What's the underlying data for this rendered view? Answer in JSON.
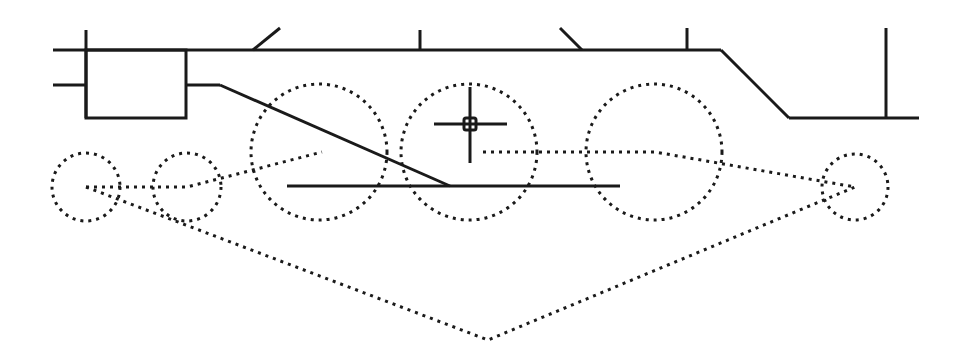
{
  "canvas": {
    "width": 954,
    "height": 362,
    "background": "#ffffff",
    "ink_color": "#1a1a1a"
  },
  "frame": {
    "top_line": [
      [
        53,
        50
      ],
      [
        721,
        50
      ]
    ],
    "cab_slope": [
      [
        721,
        50
      ],
      [
        789,
        118
      ]
    ],
    "bottom_right_line": [
      [
        789,
        118
      ],
      [
        919,
        118
      ]
    ],
    "verticals": [
      [
        [
          86,
          30
        ],
        [
          86,
          118
        ]
      ],
      [
        [
          420,
          30
        ],
        [
          420,
          50
        ]
      ],
      [
        [
          687,
          28
        ],
        [
          687,
          50
        ]
      ],
      [
        [
          886,
          28
        ],
        [
          886,
          118
        ]
      ]
    ],
    "slant_stubs": [
      [
        [
          253,
          50
        ],
        [
          280,
          28
        ]
      ],
      [
        [
          582,
          50
        ],
        [
          560,
          28
        ]
      ]
    ],
    "box": {
      "x": 86,
      "y": 50,
      "w": 100,
      "h": 68
    },
    "left_stub": [
      [
        53,
        85
      ],
      [
        86,
        85
      ]
    ],
    "right_stub": [
      [
        186,
        85
      ],
      [
        220,
        85
      ]
    ],
    "connecting_rod": [
      [
        220,
        85
      ],
      [
        450,
        186
      ]
    ],
    "main_rod": [
      [
        287,
        186
      ],
      [
        620,
        186
      ]
    ]
  },
  "wheels": [
    {
      "name": "front-small-wheel-1",
      "cx": 86,
      "cy": 187,
      "r": 34
    },
    {
      "name": "front-small-wheel-2",
      "cx": 187,
      "cy": 187,
      "r": 34
    },
    {
      "name": "driver-wheel-1",
      "cx": 319,
      "cy": 152,
      "r": 68
    },
    {
      "name": "driver-wheel-2",
      "cx": 469,
      "cy": 152,
      "r": 68
    },
    {
      "name": "driver-wheel-3",
      "cx": 654,
      "cy": 152,
      "r": 68
    },
    {
      "name": "rear-small-wheel",
      "cx": 855,
      "cy": 187,
      "r": 33
    }
  ],
  "links": [
    {
      "name": "front-link",
      "points": [
        [
          86,
          187
        ],
        [
          187,
          187
        ],
        [
          322,
          152
        ]
      ]
    },
    {
      "name": "rear-link",
      "points": [
        [
          483,
          152
        ],
        [
          655,
          152
        ],
        [
          855,
          187
        ]
      ]
    },
    {
      "name": "lower-span-link",
      "points": [
        [
          86,
          187
        ],
        [
          488,
          340
        ],
        [
          855,
          187
        ]
      ]
    }
  ],
  "cursor": {
    "type": "crosshair",
    "x": 470,
    "y": 124,
    "h_extent": [
      434,
      507
    ],
    "v_extent": [
      87,
      163
    ],
    "box_size": 12
  }
}
